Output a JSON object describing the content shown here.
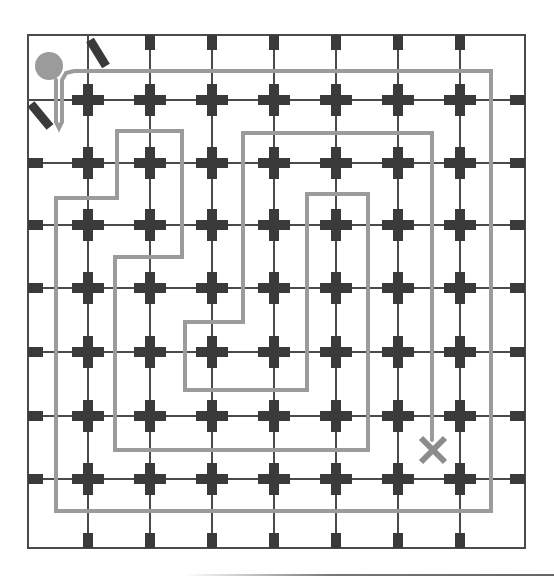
{
  "puzzle": {
    "title": "Grid spiral path puzzle",
    "colors": {
      "background": "#ffffff",
      "grid_line": "#4a4a4a",
      "node": "#3a3a3a",
      "path": "#9b9b9b",
      "start_marker": "#9b9b9b",
      "end_marker": "#8c8c8c",
      "barrier": "#3a3a3a"
    },
    "border": {
      "x1": 28,
      "y1": 35,
      "x2": 525,
      "y2": 548
    },
    "grid": {
      "columns_x": [
        88,
        150,
        212,
        274,
        336,
        398,
        460
      ],
      "rows_y": [
        100,
        163,
        225,
        288,
        352,
        416,
        479
      ],
      "node_shape": "cross-icon",
      "edge_stub_shape": "square-stub"
    },
    "start": {
      "icon": "circle-start-icon",
      "cx": 49,
      "cy": 66,
      "r": 14
    },
    "end": {
      "icon": "x-end-icon",
      "cx": 433,
      "cy": 450,
      "size": 12
    },
    "barriers": [
      {
        "name": "barrier-top",
        "x1": 90,
        "y1": 40,
        "x2": 106,
        "y2": 66
      },
      {
        "name": "barrier-left",
        "x1": 31,
        "y1": 104,
        "x2": 50,
        "y2": 127
      }
    ],
    "path": {
      "points": [
        [
          56,
          80
        ],
        [
          56,
          122
        ],
        [
          59,
          128
        ],
        [
          62,
          122
        ],
        [
          62,
          80
        ],
        [
          66,
          73
        ],
        [
          74,
          71
        ],
        [
          491,
          71
        ],
        [
          491,
          511
        ],
        [
          56,
          511
        ],
        [
          56,
          198
        ],
        [
          117,
          198
        ],
        [
          117,
          131
        ],
        [
          182,
          131
        ],
        [
          182,
          257
        ],
        [
          115,
          257
        ],
        [
          115,
          450
        ],
        [
          368,
          450
        ],
        [
          368,
          194
        ],
        [
          307,
          194
        ],
        [
          307,
          390
        ],
        [
          185,
          390
        ],
        [
          185,
          322
        ],
        [
          243,
          322
        ],
        [
          243,
          133
        ],
        [
          432,
          133
        ],
        [
          432,
          440
        ]
      ]
    }
  }
}
